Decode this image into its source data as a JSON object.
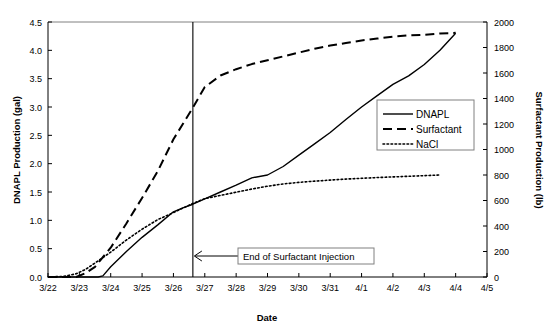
{
  "chart_data": {
    "type": "line",
    "title": "",
    "xlabel": "Date",
    "ylabel": "DNAPL Production (gal)",
    "y2label": "Surfactant Production (lb)",
    "x_tick_labels": [
      "3/22",
      "3/23",
      "3/24",
      "3/25",
      "3/26",
      "3/27",
      "3/28",
      "3/29",
      "3/30",
      "3/31",
      "4/1",
      "4/2",
      "4/3",
      "4/4",
      "4/5"
    ],
    "y_tick_labels": [
      "0.0",
      "0.5",
      "1.0",
      "1.5",
      "2.0",
      "2.5",
      "3.0",
      "3.5",
      "4.0",
      "4.5"
    ],
    "y2_tick_labels": [
      "0",
      "200",
      "400",
      "600",
      "800",
      "1000",
      "1200",
      "1400",
      "1600",
      "1800",
      "2000"
    ],
    "ylim": [
      0,
      4.5
    ],
    "y2lim": [
      0,
      2000
    ],
    "xlim": [
      0,
      14
    ],
    "grid": false,
    "legend_position": "center-right",
    "series": [
      {
        "name": "DNAPL",
        "style": "solid",
        "axis": "left",
        "x": [
          0,
          1,
          1.6,
          1.75,
          2.0,
          2.5,
          3.0,
          3.5,
          4.0,
          4.3,
          4.6,
          5.0,
          5.5,
          6.0,
          6.5,
          7.0,
          7.5,
          8.0,
          8.5,
          9.0,
          9.5,
          10.0,
          10.5,
          11.0,
          11.5,
          12.0,
          12.5,
          13.0
        ],
        "y": [
          0.0,
          0.0,
          0.0,
          0.02,
          0.18,
          0.45,
          0.7,
          0.92,
          1.15,
          1.22,
          1.28,
          1.38,
          1.5,
          1.62,
          1.75,
          1.8,
          1.95,
          2.15,
          2.35,
          2.55,
          2.78,
          3.0,
          3.2,
          3.4,
          3.55,
          3.75,
          4.0,
          4.3
        ]
      },
      {
        "name": "Surfactant",
        "style": "dashed",
        "axis": "right",
        "x": [
          0,
          0.9,
          1.2,
          1.5,
          2.0,
          2.5,
          3.0,
          3.5,
          4.0,
          4.3,
          4.6,
          5.0,
          5.5,
          6.0,
          6.5,
          7.0,
          7.5,
          8.0,
          8.5,
          9.0,
          9.5,
          10.0,
          10.5,
          11.0,
          11.5,
          12.0,
          12.5,
          13.0
        ],
        "y": [
          0,
          0,
          30,
          80,
          230,
          420,
          620,
          830,
          1080,
          1200,
          1320,
          1490,
          1580,
          1630,
          1670,
          1700,
          1730,
          1760,
          1790,
          1815,
          1835,
          1855,
          1870,
          1885,
          1895,
          1900,
          1910,
          1915
        ]
      },
      {
        "name": "NaCl",
        "style": "dotted",
        "axis": "right",
        "x": [
          0,
          0.5,
          0.9,
          1.2,
          1.5,
          2.0,
          2.5,
          3.0,
          3.5,
          4.0,
          4.3,
          4.6,
          5.0,
          5.5,
          6.0,
          6.5,
          7.0,
          7.5,
          8.0,
          8.5,
          9.0,
          9.5,
          10.0,
          10.5,
          11.0,
          11.5,
          12.0,
          12.5
        ],
        "y": [
          0,
          5,
          25,
          60,
          110,
          195,
          290,
          375,
          450,
          505,
          540,
          575,
          615,
          640,
          665,
          690,
          712,
          730,
          742,
          752,
          760,
          768,
          774,
          780,
          785,
          790,
          795,
          800
        ]
      }
    ],
    "annotations": [
      {
        "name": "end-of-surfactant-injection",
        "text": "End of Surfactant Injection",
        "x": 4.62,
        "type": "vertical-line-with-arrow-callout"
      }
    ]
  },
  "legend": {
    "entries": [
      {
        "label": "DNAPL",
        "style": "solid"
      },
      {
        "label": "Surfactant",
        "style": "dashed"
      },
      {
        "label": "NaCl",
        "style": "dotted"
      }
    ]
  },
  "colors": {
    "line": "#000000",
    "frame": "#808080",
    "text": "#000000",
    "background": "#ffffff"
  }
}
